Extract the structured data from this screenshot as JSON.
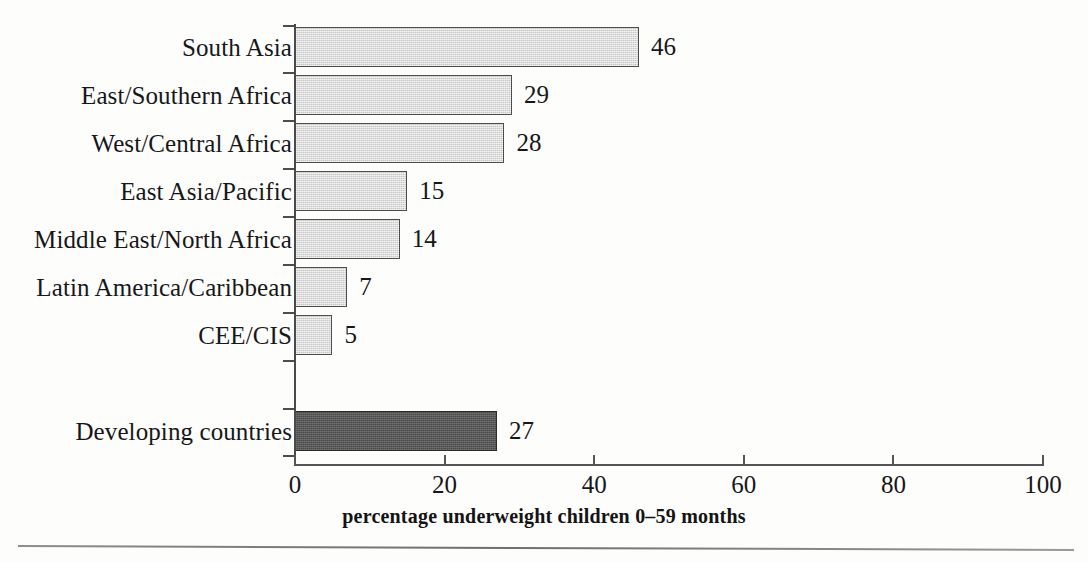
{
  "chart_data": {
    "type": "bar",
    "orientation": "horizontal",
    "title": "",
    "subtitle": "",
    "xlabel": "percentage underweight children 0–59 months",
    "ylabel": "",
    "xlim": [
      0,
      100
    ],
    "xticks": [
      0,
      20,
      40,
      60,
      80,
      100
    ],
    "xtick_labels": [
      "0",
      "20",
      "40",
      "60",
      "80",
      "100"
    ],
    "grid": false,
    "legend": false,
    "categories": [
      "South Asia",
      "East/Southern Africa",
      "West/Central Africa",
      "East Asia/Pacific",
      "Middle East/North Africa",
      "Latin America/Caribbean",
      "CEE/CIS",
      "Developing countries"
    ],
    "values": [
      46,
      29,
      28,
      15,
      14,
      7,
      5,
      27
    ],
    "value_labels": [
      "46",
      "29",
      "28",
      "15",
      "14",
      "7",
      "5",
      "27"
    ],
    "bars": [
      {
        "category": "South Asia",
        "value": 46,
        "label": "46",
        "highlight": false
      },
      {
        "category": "East/Southern Africa",
        "value": 29,
        "label": "29",
        "highlight": false
      },
      {
        "category": "West/Central Africa",
        "value": 28,
        "label": "28",
        "highlight": false
      },
      {
        "category": "East Asia/Pacific",
        "value": 15,
        "label": "15",
        "highlight": false
      },
      {
        "category": "Middle East/North Africa",
        "value": 14,
        "label": "14",
        "highlight": false
      },
      {
        "category": "Latin America/Caribbean",
        "value": 7,
        "label": "7",
        "highlight": false
      },
      {
        "category": "CEE/CIS",
        "value": 5,
        "label": "5",
        "highlight": false
      },
      {
        "category": "",
        "value": 0,
        "label": "",
        "highlight": false
      },
      {
        "category": "Developing countries",
        "value": 27,
        "label": "27",
        "highlight": true
      }
    ],
    "colors": {
      "bar_fill": "#c9c9c9",
      "bar_stroke": "#4e4e4e",
      "highlight_fill": "#4a4a4a",
      "highlight_stroke": "#2b2b2b",
      "axis": "#555555",
      "text": "#17171a",
      "background": "#fdfdfc"
    }
  }
}
